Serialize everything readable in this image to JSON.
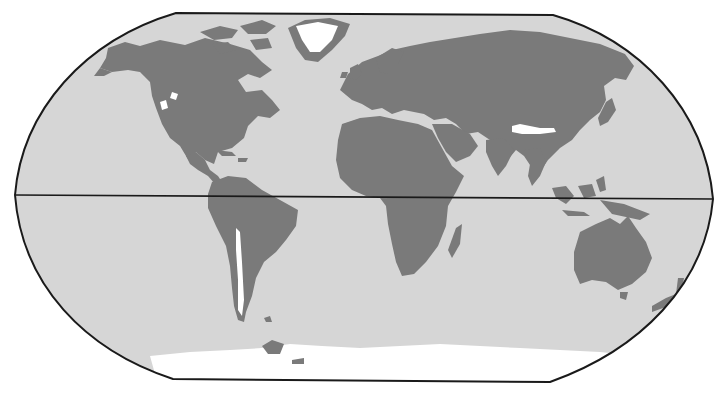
{
  "map": {
    "projection": "Robinson",
    "width": 725,
    "height": 399,
    "colors": {
      "ocean": "#d6d6d6",
      "land": "#7a7a7a",
      "ice": "#ffffff",
      "frame": "#1a1a1a",
      "background": "#ffffff"
    },
    "frame": {
      "top_left": [
        176,
        13
      ],
      "top_right": [
        553,
        15
      ],
      "left_extreme": [
        15,
        195
      ],
      "right_extreme": [
        713,
        199
      ],
      "bottom_left": [
        173,
        379
      ],
      "bottom_right": [
        550,
        382
      ]
    },
    "equator": {
      "y_left": 195,
      "y_right": 199,
      "label": ""
    },
    "layers": [
      "ocean",
      "land",
      "ice-glaciers",
      "equator",
      "frame"
    ],
    "regions": [
      "north-america",
      "greenland",
      "south-america",
      "europe-asia",
      "africa",
      "madagascar",
      "arabia",
      "australia",
      "new-zealand",
      "southeast-asia-islands",
      "japan",
      "antarctica",
      "british-isles",
      "arctic-islands",
      "caribbean"
    ]
  },
  "caption": ""
}
